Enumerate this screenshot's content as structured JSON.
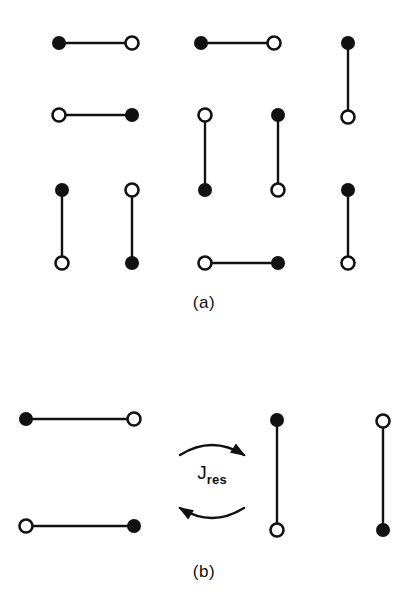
{
  "figure": {
    "width": 416,
    "height": 615,
    "background_color": "#ffffff",
    "ink_color": "#111111",
    "node_radius_filled": 7.0,
    "node_radius_open": 6.5,
    "open_node_stroke": 2.6,
    "bond_stroke": 2.4
  },
  "panels": [
    {
      "id": "a",
      "caption": "(a)",
      "caption_x": 204,
      "caption_y": 305,
      "description": "Eight randomly oriented dumbbells with distinguishable ends",
      "dumbbells": [
        {
          "name": "dumbbell-a1",
          "orientation": "horizontal",
          "x1": 59,
          "y1": 43,
          "x2": 132,
          "y2": 43,
          "end1": "filled",
          "end2": "open"
        },
        {
          "name": "dumbbell-a2",
          "orientation": "horizontal",
          "x1": 201,
          "y1": 43,
          "x2": 274,
          "y2": 43,
          "end1": "filled",
          "end2": "open"
        },
        {
          "name": "dumbbell-a3",
          "orientation": "vertical",
          "x1": 348,
          "y1": 43,
          "x2": 348,
          "y2": 117,
          "end1": "filled",
          "end2": "open"
        },
        {
          "name": "dumbbell-a4",
          "orientation": "horizontal",
          "x1": 59,
          "y1": 115,
          "x2": 132,
          "y2": 115,
          "end1": "open",
          "end2": "filled"
        },
        {
          "name": "dumbbell-a5",
          "orientation": "vertical",
          "x1": 205,
          "y1": 115,
          "x2": 205,
          "y2": 190,
          "end1": "open",
          "end2": "filled"
        },
        {
          "name": "dumbbell-a6",
          "orientation": "vertical",
          "x1": 278,
          "y1": 115,
          "x2": 278,
          "y2": 190,
          "end1": "filled",
          "end2": "open"
        },
        {
          "name": "dumbbell-a7",
          "orientation": "vertical",
          "x1": 62,
          "y1": 190,
          "x2": 62,
          "y2": 263,
          "end1": "filled",
          "end2": "open"
        },
        {
          "name": "dumbbell-a8",
          "orientation": "vertical",
          "x1": 132,
          "y1": 190,
          "x2": 132,
          "y2": 263,
          "end1": "open",
          "end2": "filled"
        },
        {
          "name": "dumbbell-a9",
          "orientation": "horizontal",
          "x1": 205,
          "y1": 263,
          "x2": 278,
          "y2": 263,
          "end1": "open",
          "end2": "filled"
        },
        {
          "name": "dumbbell-a10",
          "orientation": "vertical",
          "x1": 348,
          "y1": 190,
          "x2": 348,
          "y2": 263,
          "end1": "filled",
          "end2": "open"
        }
      ]
    },
    {
      "id": "b",
      "caption": "(b)",
      "caption_x": 204,
      "caption_y": 574,
      "description": "Two pairs of dumbbells exchanging orientation via resonant coupling",
      "dumbbells": [
        {
          "name": "dumbbell-b1",
          "orientation": "horizontal",
          "x1": 26,
          "y1": 419,
          "x2": 134,
          "y2": 419,
          "end1": "filled",
          "end2": "open"
        },
        {
          "name": "dumbbell-b2",
          "orientation": "horizontal",
          "x1": 26,
          "y1": 526,
          "x2": 134,
          "y2": 526,
          "end1": "open",
          "end2": "filled"
        },
        {
          "name": "dumbbell-b3",
          "orientation": "vertical",
          "x1": 277,
          "y1": 420,
          "x2": 277,
          "y2": 530,
          "end1": "filled",
          "end2": "open"
        },
        {
          "name": "dumbbell-b4",
          "orientation": "vertical",
          "x1": 383,
          "y1": 421,
          "x2": 383,
          "y2": 530,
          "end1": "open",
          "end2": "filled"
        }
      ],
      "coupling": {
        "name": "resonant-coupling",
        "symbol": "J",
        "subscript": "res",
        "label_x": 212,
        "label_y": 477,
        "arrow_top": {
          "direction": "right",
          "x_start": 180,
          "y_start": 455,
          "x_end": 244,
          "y_end": 455
        },
        "arrow_bottom": {
          "direction": "left",
          "x_start": 244,
          "y_start": 508,
          "x_end": 180,
          "y_end": 508
        }
      }
    }
  ],
  "legend_semantics": {
    "filled_circle": "filled-end-node",
    "open_circle": "open-end-node",
    "bond": "rigid-bond"
  }
}
